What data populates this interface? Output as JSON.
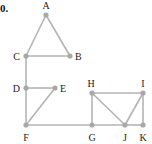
{
  "problem_number": "0.",
  "colors": {
    "edge": "#b4b4b4",
    "node": "#a8a8a8",
    "label": "#222222"
  },
  "graph": {
    "vertices": [
      {
        "id": "A",
        "x": 46,
        "y": 15,
        "lx": 46,
        "ly": 9,
        "anchor": "middle"
      },
      {
        "id": "B",
        "x": 70,
        "y": 56,
        "lx": 75,
        "ly": 60,
        "anchor": "start"
      },
      {
        "id": "C",
        "x": 26,
        "y": 56,
        "lx": 20,
        "ly": 60,
        "anchor": "end"
      },
      {
        "id": "D",
        "x": 26,
        "y": 88,
        "lx": 20,
        "ly": 92,
        "anchor": "end"
      },
      {
        "id": "E",
        "x": 55,
        "y": 88,
        "lx": 60,
        "ly": 92,
        "anchor": "start"
      },
      {
        "id": "F",
        "x": 26,
        "y": 125,
        "lx": 26,
        "ly": 141,
        "anchor": "middle"
      },
      {
        "id": "G",
        "x": 92,
        "y": 125,
        "lx": 92,
        "ly": 141,
        "anchor": "middle"
      },
      {
        "id": "H",
        "x": 92,
        "y": 93,
        "lx": 91,
        "ly": 87,
        "anchor": "middle"
      },
      {
        "id": "I",
        "x": 143,
        "y": 93,
        "lx": 143,
        "ly": 87,
        "anchor": "middle"
      },
      {
        "id": "J",
        "x": 125,
        "y": 125,
        "lx": 125,
        "ly": 141,
        "anchor": "middle"
      },
      {
        "id": "K",
        "x": 143,
        "y": 125,
        "lx": 143,
        "ly": 141,
        "anchor": "middle"
      }
    ],
    "edges": [
      [
        "A",
        "B"
      ],
      [
        "A",
        "C"
      ],
      [
        "C",
        "B"
      ],
      [
        "C",
        "D"
      ],
      [
        "D",
        "E"
      ],
      [
        "D",
        "F"
      ],
      [
        "E",
        "F"
      ],
      [
        "F",
        "G"
      ],
      [
        "G",
        "H"
      ],
      [
        "H",
        "I"
      ],
      [
        "H",
        "J"
      ],
      [
        "G",
        "J"
      ],
      [
        "J",
        "I"
      ],
      [
        "J",
        "K"
      ],
      [
        "I",
        "K"
      ]
    ]
  }
}
